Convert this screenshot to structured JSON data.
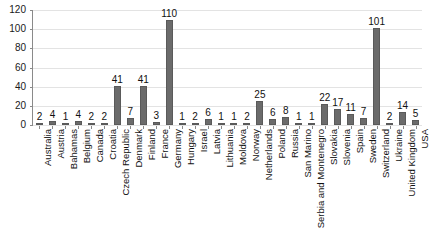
{
  "chart_data": {
    "type": "bar",
    "title": "",
    "subtitle": "",
    "xlabel": "",
    "ylabel": "",
    "ylim": [
      0,
      120
    ],
    "yticks": [
      0,
      20,
      40,
      60,
      80,
      100,
      120
    ],
    "grid": true,
    "legend": false,
    "legend_position": "none",
    "bar_color": "#6b6b6b",
    "gridline_color": "#e3e3e3",
    "axis_color": "#8a8a8a",
    "background_color": "#ffffff",
    "data_labels": true,
    "categories": [
      "Australia",
      "Austria",
      "Bahamas",
      "Belgium",
      "Canada",
      "Croatia",
      "Czech Republic",
      "Denmark",
      "Finland",
      "France",
      "Germany",
      "Hungary",
      "Israel",
      "Latvia",
      "Lithuania",
      "Moldova",
      "Norway",
      "Netherlands",
      "Poland",
      "Russia",
      "San Marino",
      "Serbia and Montenegro",
      "Slovakia",
      "Slovenia",
      "Spain",
      "Sweden",
      "Switzerland",
      "Ukraine",
      "United Kingdom",
      "USA"
    ],
    "values": [
      2,
      4,
      1,
      4,
      2,
      2,
      41,
      7,
      41,
      3,
      110,
      1,
      2,
      6,
      1,
      1,
      2,
      25,
      6,
      8,
      1,
      1,
      22,
      17,
      11,
      7,
      101,
      2,
      14,
      5
    ]
  }
}
